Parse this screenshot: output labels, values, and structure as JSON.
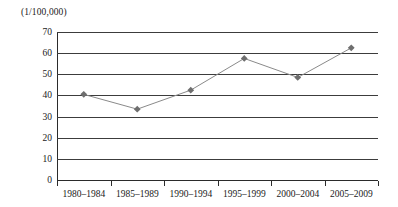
{
  "chart_data": {
    "type": "line",
    "title": "(1/100,000)",
    "xlabel": "",
    "ylabel": "(1/100,000)",
    "categories": [
      "1980–1984",
      "1985–1989",
      "1990–1994",
      "1995–1999",
      "2000–2004",
      "2005–2009"
    ],
    "values": [
      40.5,
      33.5,
      42.5,
      57.5,
      48.5,
      62.5
    ],
    "series": [
      {
        "name": "rate",
        "values": [
          40.5,
          33.5,
          42.5,
          57.5,
          48.5,
          62.5
        ]
      }
    ],
    "ylim": [
      0,
      70
    ],
    "y_ticks": [
      0,
      10,
      20,
      30,
      40,
      50,
      60,
      70
    ],
    "y_tick_labels": [
      "0",
      "10",
      "20",
      "30",
      "40",
      "50",
      "60",
      "70"
    ],
    "grid": true,
    "legend": "none",
    "marker": "diamond",
    "marker_color": "#6e6e6e",
    "line_color": "#8a8a8a",
    "axis_color": "#2b2b2b",
    "background": "#ffffff"
  }
}
